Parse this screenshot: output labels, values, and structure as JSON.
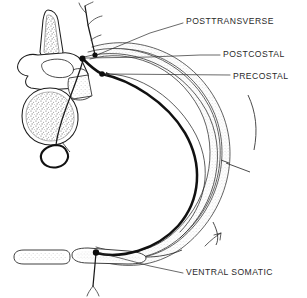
{
  "figure": {
    "background_color": "#ffffff",
    "ink_color": "#1a1a1a",
    "stipple_color": "#8d8d8d",
    "width": 307,
    "height": 298
  },
  "labels": [
    {
      "id": "posttransverse",
      "text": "POSTTRANSVERSE",
      "text_x": 186,
      "text_y": 22,
      "anchor_x": 95,
      "anchor_y": 55,
      "marker": "dot"
    },
    {
      "id": "postcostal",
      "text": "POSTCOSTAL",
      "text_x": 223,
      "text_y": 55,
      "anchor_x": 83,
      "anchor_y": 59,
      "marker": "dot"
    },
    {
      "id": "precostal",
      "text": "PRECOSTAL",
      "text_x": 233,
      "text_y": 78,
      "anchor_x": 102,
      "anchor_y": 74,
      "marker": "arrow"
    },
    {
      "id": "ventral-somatic",
      "text": "VENTRAL SOMATIC",
      "text_x": 186,
      "text_y": 273,
      "anchor_x": 96,
      "anchor_y": 253,
      "marker": "line"
    }
  ],
  "anatomy": {
    "spinous_process": {
      "name": "spinous-process",
      "stippled": true
    },
    "vertebral_arch": {
      "name": "vertebral-arch",
      "stippled": false
    },
    "vertebral_body": {
      "name": "vertebral-body",
      "stippled": true
    },
    "transverse_process": {
      "name": "transverse-process",
      "stippled": true
    },
    "rib": {
      "name": "rib-shaft",
      "stippled": true,
      "has_costal_angle": true
    },
    "costal_cartilage": {
      "name": "costal-cartilage",
      "stippled": true
    },
    "sternum": {
      "name": "sternum",
      "stippled": true
    },
    "spinal_cord_loop": {
      "name": "spinal-canal-loop"
    }
  },
  "vessels": {
    "main_artery": {
      "name": "intercostal-artery",
      "stroke_width": 2.5
    },
    "junction_nodes": [
      {
        "name": "posttransverse-origin",
        "x": 95,
        "y": 55
      },
      {
        "name": "postcostal-origin",
        "x": 83,
        "y": 59
      },
      {
        "name": "precostal-origin",
        "x": 102,
        "y": 74
      },
      {
        "name": "ventral-somatic-origin",
        "x": 96,
        "y": 253
      }
    ]
  }
}
